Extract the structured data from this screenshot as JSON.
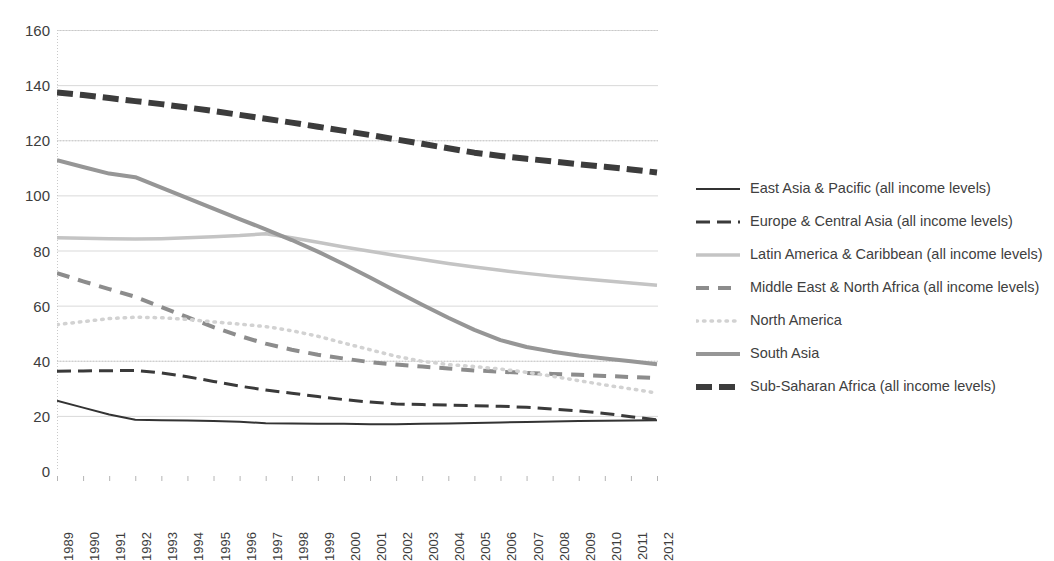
{
  "chart_data": {
    "type": "line",
    "title": "",
    "xlabel": "",
    "ylabel": "",
    "ylim": [
      0,
      160
    ],
    "ytick_step": 20,
    "yticks": [
      0,
      20,
      40,
      60,
      80,
      100,
      120,
      140,
      160
    ],
    "grid": true,
    "legend_position": "right",
    "x": [
      1989,
      1990,
      1991,
      1992,
      1993,
      1994,
      1995,
      1996,
      1997,
      1998,
      1999,
      2000,
      2001,
      2002,
      2003,
      2004,
      2005,
      2006,
      2007,
      2008,
      2009,
      2010,
      2011,
      2012
    ],
    "categories": [
      "1989",
      "1990",
      "1991",
      "1992",
      "1993",
      "1994",
      "1995",
      "1996",
      "1997",
      "1998",
      "1999",
      "2000",
      "2001",
      "2002",
      "2003",
      "2004",
      "2005",
      "2006",
      "2007",
      "2008",
      "2009",
      "2010",
      "2011",
      "2012"
    ],
    "series": [
      {
        "name": "East Asia & Pacific (all income levels)",
        "color": "#333333",
        "width": 2,
        "dash": "none",
        "values": [
          25.5,
          23.0,
          20.5,
          18.6,
          18.4,
          18.3,
          18.1,
          17.9,
          17.3,
          17.2,
          17.1,
          17.1,
          17.0,
          17.0,
          17.1,
          17.2,
          17.4,
          17.6,
          17.8,
          18.0,
          18.1,
          18.2,
          18.3,
          18.4
        ]
      },
      {
        "name": "Europe & Central Asia (all income levels)",
        "color": "#3a3a3a",
        "width": 3,
        "dash": "14,7",
        "values": [
          36.2,
          36.3,
          36.4,
          36.5,
          35.6,
          34.2,
          32.5,
          30.8,
          29.4,
          28.2,
          27.0,
          25.9,
          25.0,
          24.3,
          24.1,
          23.9,
          23.7,
          23.5,
          23.1,
          22.5,
          21.8,
          20.9,
          19.7,
          18.6
        ]
      },
      {
        "name": "Latin America & Caribbean (all income levels)",
        "color": "#c4c4c4",
        "width": 3.5,
        "dash": "none",
        "values": [
          84.6,
          84.4,
          84.3,
          84.2,
          84.3,
          84.6,
          85.0,
          85.4,
          86.1,
          84.6,
          83.0,
          81.3,
          79.7,
          78.2,
          76.7,
          75.3,
          74.0,
          72.8,
          71.7,
          70.7,
          69.8,
          69.0,
          68.2,
          67.4
        ]
      },
      {
        "name": "Middle East & North Africa (all income levels)",
        "color": "#8c8c8c",
        "width": 4,
        "dash": "13,9",
        "values": [
          71.8,
          68.8,
          66.0,
          63.2,
          59.5,
          55.8,
          52.2,
          49.0,
          46.2,
          44.0,
          42.2,
          40.8,
          39.5,
          38.6,
          37.9,
          37.2,
          36.5,
          36.0,
          35.6,
          35.2,
          34.9,
          34.5,
          34.1,
          33.7
        ]
      },
      {
        "name": "North America",
        "color": "#d2d2d2",
        "width": 3.5,
        "dash": "1.5,6",
        "values": [
          53.1,
          54.2,
          55.3,
          55.8,
          55.6,
          55.0,
          54.1,
          53.3,
          52.4,
          50.9,
          48.9,
          46.4,
          44.0,
          41.6,
          39.8,
          38.6,
          37.9,
          37.0,
          35.8,
          34.4,
          32.8,
          31.2,
          29.8,
          28.3
        ]
      },
      {
        "name": "South Asia",
        "color": "#969696",
        "width": 4,
        "dash": "none",
        "values": [
          112.8,
          110.3,
          107.9,
          106.6,
          102.8,
          99.0,
          95.2,
          91.4,
          87.7,
          83.8,
          79.6,
          75.0,
          70.2,
          65.2,
          60.3,
          55.6,
          51.2,
          47.5,
          45.0,
          43.3,
          41.9,
          40.8,
          39.8,
          38.7
        ]
      },
      {
        "name": "Sub-Saharan Africa (all income levels)",
        "color": "#3c3c3c",
        "width": 6,
        "dash": "16,7",
        "values": [
          137.3,
          136.4,
          135.3,
          134.2,
          133.1,
          131.9,
          130.6,
          129.2,
          127.8,
          126.4,
          124.9,
          123.4,
          121.9,
          120.3,
          118.7,
          117.1,
          115.5,
          114.3,
          113.3,
          112.3,
          111.3,
          110.4,
          109.4,
          108.3
        ]
      }
    ]
  }
}
